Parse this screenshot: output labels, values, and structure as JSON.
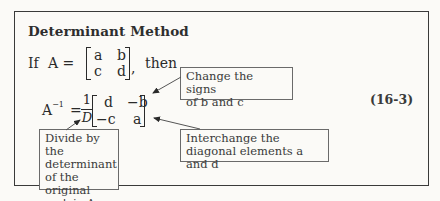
{
  "box": {
    "title": "Determinant Method",
    "equation_number": "(16-3)"
  },
  "given": {
    "if_label": "If",
    "lhs": "A =",
    "matrix": [
      [
        "a",
        "b"
      ],
      [
        "c",
        "d"
      ]
    ],
    "trailing_comma": ",",
    "then_label": "then"
  },
  "inverse": {
    "lhs_base": "A",
    "lhs_exponent": "−1",
    "equals": "=",
    "fraction_numerator": "1",
    "fraction_denominator": "D",
    "matrix": [
      [
        "d",
        "−b"
      ],
      [
        "−c",
        "a"
      ]
    ]
  },
  "callouts": {
    "change_signs": [
      "Change the signs",
      "of b and c"
    ],
    "interchange": [
      "Interchange the",
      "diagonal elements a and d"
    ],
    "divide": [
      "Divide by the",
      "determinant",
      "of the original",
      "matrix A."
    ]
  },
  "colors": {
    "ink": "#2a2a2a",
    "frame": "#3a3a3a",
    "callout_border": "#6a6a6a",
    "paper": "#fbfaf7"
  }
}
